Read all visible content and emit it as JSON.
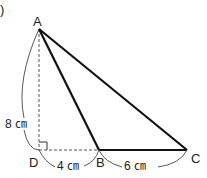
{
  "problem_label": ")",
  "points": {
    "A": {
      "label": "A",
      "x": 39,
      "y": 29
    },
    "B": {
      "label": "B",
      "x": 99,
      "y": 150
    },
    "C": {
      "label": "C",
      "x": 187,
      "y": 150
    },
    "D": {
      "label": "D",
      "x": 39,
      "y": 150
    }
  },
  "measures": {
    "AD": "8 ㎝",
    "DB": "4 ㎝",
    "BC": "6 ㎝"
  },
  "segments": [
    {
      "from": "A",
      "to": "B",
      "style": "solid"
    },
    {
      "from": "A",
      "to": "C",
      "style": "solid"
    },
    {
      "from": "B",
      "to": "C",
      "style": "solid"
    },
    {
      "from": "A",
      "to": "D",
      "style": "dashed"
    },
    {
      "from": "D",
      "to": "B",
      "style": "dashed"
    }
  ],
  "colors": {
    "line": "#111111",
    "aux": "#555555"
  }
}
